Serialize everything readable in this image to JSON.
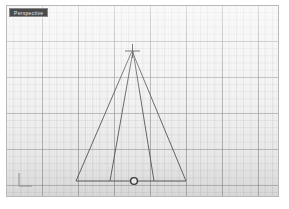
{
  "viewport": {
    "title": "Perspective",
    "background_color": "#f3f3f3",
    "border_color": "#b9b9b9",
    "width": 273,
    "height": 192,
    "grid": {
      "visible": true,
      "minor_spacing_px": 7.2,
      "major_spacing_px": 36,
      "minor_color": "#969696",
      "major_color": "#787878"
    }
  },
  "geometry": {
    "line_color": "#4c4c4c",
    "line_width": 0.9,
    "apex": {
      "x": 125,
      "y": 45,
      "marker": "cross"
    },
    "base": {
      "y": 175,
      "left_x": 69,
      "right_x": 179
    },
    "control_point": {
      "x": 127,
      "y": 175,
      "marker": "circle",
      "fill": "#ffffff",
      "stroke": "#2b2b2b",
      "radius": 3.4
    },
    "edges": [
      {
        "name": "outer-left-leg",
        "x1": 125,
        "y1": 45,
        "x2": 69,
        "y2": 175
      },
      {
        "name": "outer-right-leg",
        "x1": 125,
        "y1": 45,
        "x2": 179,
        "y2": 175
      },
      {
        "name": "inner-left-leg",
        "x1": 126,
        "y1": 45,
        "x2": 103,
        "y2": 175
      },
      {
        "name": "inner-right-leg",
        "x1": 126,
        "y1": 45,
        "x2": 147,
        "y2": 175
      },
      {
        "name": "base-line",
        "x1": 69,
        "y1": 175,
        "x2": 179,
        "y2": 175
      }
    ]
  },
  "axis_gizmo": {
    "visible": true,
    "color": "#8c8c8c",
    "x_axis_label": "x",
    "y_axis_label": "y"
  }
}
